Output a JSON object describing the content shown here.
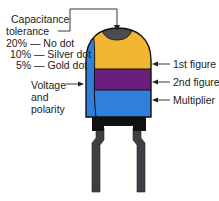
{
  "diagram": {
    "left_labels": {
      "tolerance_heading_1": "Capacitance",
      "tolerance_heading_2": "tolerance",
      "tolerance_rows": [
        "20% — No dot",
        "10% — Silver dot",
        "5% — Gold dot"
      ],
      "voltage_1": "Voltage",
      "voltage_2": "and",
      "voltage_3": "polarity"
    },
    "right_labels": {
      "band1": "1st figure",
      "band2": "2nd figure",
      "band3": "Multiplier"
    },
    "colors": {
      "top_dot": "#4a4c50",
      "band1": "#f2b632",
      "band2": "#6a1f7a",
      "band3": "#2f7fdc",
      "side_strip": "#2f7fdc",
      "base": "#111111",
      "legs": "#3d3f44",
      "outline": "#111111"
    }
  }
}
